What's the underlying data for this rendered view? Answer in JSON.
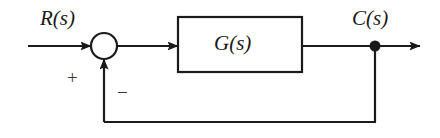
{
  "diagram": {
    "type": "control-system-block-diagram",
    "colors": {
      "background": "#ffffff",
      "stroke": "#1a1a1a",
      "label": "#1a1a1a",
      "sign": "#3a3a3a"
    },
    "labels": {
      "input_signal": "R(s)",
      "output_signal": "C(s)",
      "block_transfer_function": "G(s)",
      "summing_positive_sign": "+",
      "summing_negative_sign": "−"
    },
    "nodes": {
      "summing_junction": {
        "name": "summing-junction",
        "cx": 104,
        "cy": 46,
        "r": 13
      },
      "plant_block": {
        "name": "plant-block",
        "x": 178,
        "y": 17,
        "width": 124,
        "height": 55
      },
      "takeoff_point": {
        "name": "takeoff-point",
        "cx": 375,
        "cy": 46,
        "r": 5
      }
    },
    "edges": {
      "input_line": {
        "name": "input-line",
        "from_x": 28,
        "to_x": 91,
        "y": 46,
        "arrow": true
      },
      "error_line": {
        "name": "error-line",
        "from_x": 117,
        "to_x": 178,
        "y": 46,
        "arrow": true
      },
      "plant_output_line": {
        "name": "plant-output-line",
        "from_x": 302,
        "to_x": 375,
        "y": 46,
        "arrow": false
      },
      "output_line": {
        "name": "output-line",
        "from_x": 375,
        "to_x": 420,
        "y": 46,
        "arrow": true
      },
      "feedback_down": {
        "name": "feedback-down-line",
        "x": 375,
        "from_y": 46,
        "to_y": 122
      },
      "feedback_across": {
        "name": "feedback-across-line",
        "y": 122,
        "from_x": 375,
        "to_x": 104
      },
      "feedback_up": {
        "name": "feedback-up-line",
        "x": 104,
        "from_y": 122,
        "to_y": 59,
        "arrow": true
      }
    }
  }
}
